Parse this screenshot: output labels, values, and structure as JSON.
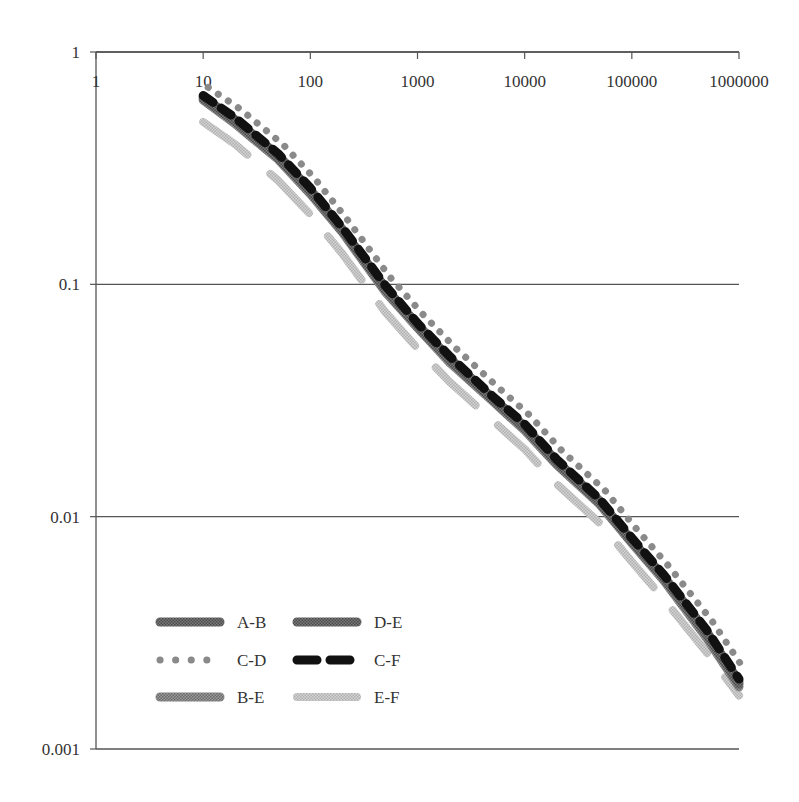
{
  "chart_data": {
    "type": "line",
    "title": "",
    "xlabel": "",
    "ylabel": "",
    "xscale": "log",
    "yscale": "log",
    "xlim": [
      1,
      1000000
    ],
    "ylim": [
      0.001,
      1
    ],
    "x_axis_position": "top",
    "grid": {
      "horizontal": true,
      "vertical": false
    },
    "x_tick_labels": [
      "1",
      "10",
      "100",
      "1000",
      "10000",
      "100000",
      "1000000"
    ],
    "y_tick_labels": [
      "1",
      "0.1",
      "0.01",
      "0.001"
    ],
    "x": [
      10,
      20,
      50,
      100,
      200,
      500,
      1000,
      2000,
      5000,
      10000,
      20000,
      50000,
      100000,
      200000,
      500000,
      1000000
    ],
    "series": [
      {
        "name": "A-B",
        "style": "solid-textured",
        "color": "#6e6e6e",
        "values": [
          0.63,
          0.5,
          0.35,
          0.25,
          0.17,
          0.095,
          0.066,
          0.047,
          0.032,
          0.024,
          0.017,
          0.0115,
          0.0078,
          0.0054,
          0.0031,
          0.0019
        ]
      },
      {
        "name": "D-E",
        "style": "solid-textured",
        "color": "#555555",
        "values": [
          0.64,
          0.51,
          0.36,
          0.255,
          0.172,
          0.097,
          0.067,
          0.048,
          0.0325,
          0.0245,
          0.0173,
          0.0117,
          0.0079,
          0.0055,
          0.0032,
          0.00195
        ]
      },
      {
        "name": "C-D",
        "style": "dotted",
        "color": "#8a8a8a",
        "values": [
          0.67,
          0.54,
          0.38,
          0.27,
          0.18,
          0.102,
          0.071,
          0.051,
          0.0345,
          0.026,
          0.0183,
          0.0124,
          0.0084,
          0.0058,
          0.0034,
          0.0021
        ]
      },
      {
        "name": "C-F",
        "style": "dashed",
        "color": "#111111",
        "values": [
          0.65,
          0.52,
          0.365,
          0.26,
          0.175,
          0.099,
          0.068,
          0.049,
          0.033,
          0.025,
          0.0176,
          0.0119,
          0.0081,
          0.0056,
          0.00325,
          0.002
        ]
      },
      {
        "name": "B-E",
        "style": "solid-textured",
        "color": "#8c8c8c",
        "values": [
          0.62,
          0.49,
          0.345,
          0.245,
          0.167,
          0.093,
          0.065,
          0.046,
          0.0315,
          0.0235,
          0.0167,
          0.0113,
          0.0077,
          0.0053,
          0.003,
          0.00185
        ]
      },
      {
        "name": "E-F",
        "style": "dashed-light",
        "color": "#bdbdbd",
        "values": [
          0.5,
          0.4,
          0.28,
          0.2,
          0.135,
          0.076,
          0.053,
          0.038,
          0.026,
          0.0195,
          0.0138,
          0.0094,
          0.0064,
          0.0044,
          0.0026,
          0.0017
        ]
      }
    ],
    "legend": {
      "position": "lower-left-inside",
      "columns": 2,
      "entries": [
        "A-B",
        "D-E",
        "C-D",
        "C-F",
        "B-E",
        "E-F"
      ]
    }
  }
}
